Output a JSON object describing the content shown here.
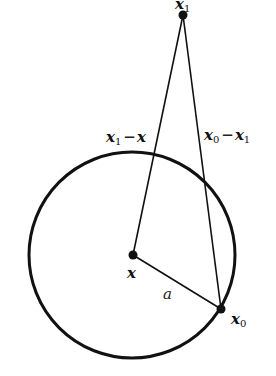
{
  "diagram": {
    "points": {
      "x": {
        "label": "x",
        "cx": 133,
        "cy": 255
      },
      "x0": {
        "label": "x",
        "sub": "0",
        "cx": 221,
        "cy": 309
      },
      "x1": {
        "label": "x",
        "sub": "1",
        "cx": 183,
        "cy": 15
      }
    },
    "circle": {
      "cx": 132,
      "cy": 255,
      "r": 103
    },
    "edges": {
      "x1_minus_x": {
        "a": "x",
        "sub_a": "1",
        "op": "−",
        "b": "x"
      },
      "x0_minus_x1": {
        "a": "x",
        "sub_a": "0",
        "op": "−",
        "b": "x",
        "sub_b": "1"
      },
      "radius": {
        "label": "a"
      }
    }
  }
}
